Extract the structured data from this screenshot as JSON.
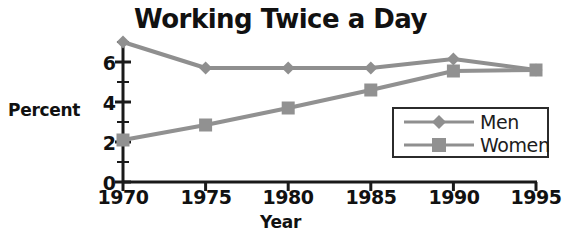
{
  "chart_data": {
    "type": "line",
    "title": "Working Twice a Day",
    "xlabel": "Year",
    "ylabel": "Percent",
    "categories": [
      1970,
      1975,
      1980,
      1985,
      1990,
      1995
    ],
    "x_tick_labels": [
      "1970",
      "1975",
      "1980",
      "1985",
      "1990",
      "1995"
    ],
    "y_tick_labels": [
      "0",
      "2",
      "4",
      "6"
    ],
    "y_major_ticks": [
      0,
      2,
      4,
      6
    ],
    "y_minor_ticks": [
      1,
      3,
      5,
      7
    ],
    "ylim": [
      0,
      7.4
    ],
    "xlim": [
      1970,
      1995
    ],
    "grid": false,
    "legend_position": "lower-right",
    "series": [
      {
        "name": "Men",
        "marker": "diamond",
        "color": "#8f8f8f",
        "values": [
          7.0,
          5.7,
          5.7,
          5.7,
          6.15,
          5.6
        ]
      },
      {
        "name": "Women",
        "marker": "square",
        "color": "#919191",
        "values": [
          2.1,
          2.85,
          3.7,
          4.6,
          5.55,
          5.6
        ]
      }
    ]
  },
  "legend": {
    "items": [
      {
        "label": "Men"
      },
      {
        "label": "Women"
      }
    ]
  },
  "colors": {
    "line": "#8f8f8f",
    "marker": "#8f8f8f",
    "axis": "#1a1a1a",
    "text": "#111111",
    "background": "#ffffff"
  }
}
